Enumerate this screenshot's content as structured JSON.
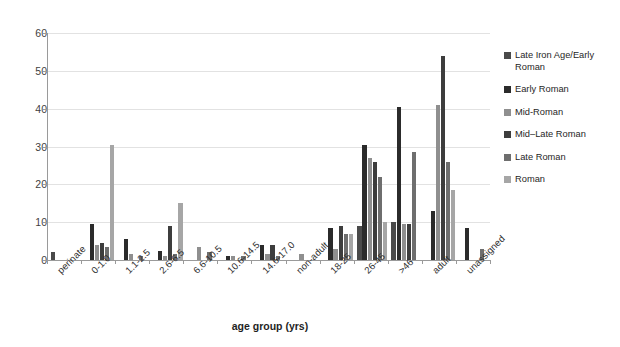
{
  "chart_data": {
    "type": "bar",
    "title": "",
    "xlabel": "age group (yrs)",
    "ylabel": "",
    "ylim": [
      0,
      60
    ],
    "yticks": [
      0,
      10,
      20,
      30,
      40,
      50,
      60
    ],
    "grid": true,
    "legend_position": "right",
    "categories": [
      "perinate",
      "0-1.0",
      "1.1-2.5",
      "2.6-6.5",
      "6.6-10.5",
      "10.6-14.5",
      "14.6-17.0",
      "non-adult",
      "18-25",
      "26-45",
      ">46",
      "adult",
      "unassigned"
    ],
    "series": [
      {
        "name": "Late Iron Age/Early Roman",
        "color": "#4a4a4a",
        "values": [
          2,
          0,
          0,
          0,
          0,
          0,
          0,
          0,
          0,
          9,
          10,
          0,
          0
        ]
      },
      {
        "name": "Early Roman",
        "color": "#2b2b2b",
        "values": [
          0,
          9.5,
          5.5,
          2.5,
          0,
          1,
          4,
          0,
          8.5,
          30.5,
          40.5,
          13,
          8.5
        ]
      },
      {
        "name": "Mid-Roman",
        "color": "#8f8f8f",
        "values": [
          0,
          4,
          1.5,
          1,
          3.5,
          1,
          1.5,
          1.5,
          3,
          27,
          9.5,
          41,
          0
        ]
      },
      {
        "name": "Mid–Late Roman",
        "color": "#3d3d3d",
        "values": [
          0,
          4.5,
          0,
          9,
          0,
          0,
          4,
          0,
          9,
          26,
          9.5,
          54,
          0
        ]
      },
      {
        "name": "Late Roman",
        "color": "#6e6e6e",
        "values": [
          0,
          3.5,
          1,
          1.5,
          2,
          1,
          1,
          0,
          7,
          22,
          28.5,
          26,
          3
        ]
      },
      {
        "name": "Roman",
        "color": "#a6a6a6",
        "values": [
          0,
          30.5,
          0,
          15,
          0,
          0,
          0,
          0,
          7,
          10,
          0,
          18.5,
          0
        ]
      }
    ]
  },
  "legend": {
    "items": [
      "Late Iron Age/Early Roman",
      "Early Roman",
      "Mid-Roman",
      "Mid–Late Roman",
      "Late Roman",
      "Roman"
    ]
  }
}
